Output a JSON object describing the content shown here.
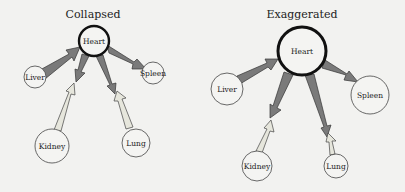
{
  "panels": [
    {
      "title": "Collapsed",
      "nodes": {
        "heart": "Heart",
        "liver": "Liver",
        "spleen": "Spleen",
        "kidney": "Kidney",
        "lung": "Lung"
      }
    },
    {
      "title": "Exaggerated",
      "nodes": {
        "heart": "Heart",
        "liver": "Liver",
        "spleen": "Spleen",
        "kidney": "Kidney",
        "lung": "Lung"
      }
    }
  ],
  "colors": {
    "dark_arrow": "#7a7a7a",
    "light_arrow": "#e6e6dc",
    "node_stroke": "#333333",
    "background": "#f2f2f0"
  }
}
